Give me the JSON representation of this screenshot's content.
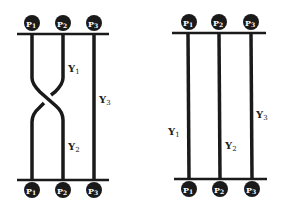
{
  "diagrams": [
    {
      "name": "braided",
      "top_points": [
        "P1",
        "P2",
        "P3"
      ],
      "bottom_points": [
        "P1",
        "P2",
        "P3"
      ],
      "strand_labels": {
        "y1": "Y",
        "y1_sub": "1",
        "y2": "Y",
        "y2_sub": "2",
        "y3": "Y",
        "y3_sub": "3"
      }
    },
    {
      "name": "straight",
      "top_points": [
        "P1",
        "P2",
        "P3"
      ],
      "bottom_points": [
        "P1",
        "P2",
        "P3"
      ],
      "strand_labels": {
        "y1": "Y",
        "y1_sub": "1",
        "y2": "Y",
        "y2_sub": "2",
        "y3": "Y",
        "y3_sub": "3"
      }
    }
  ],
  "ball_letter": "P",
  "subs": [
    "1",
    "2",
    "3"
  ],
  "colors": {
    "stroke": "#1a1a1a",
    "ball": "#1a1a1a",
    "background": "#ffffff"
  }
}
